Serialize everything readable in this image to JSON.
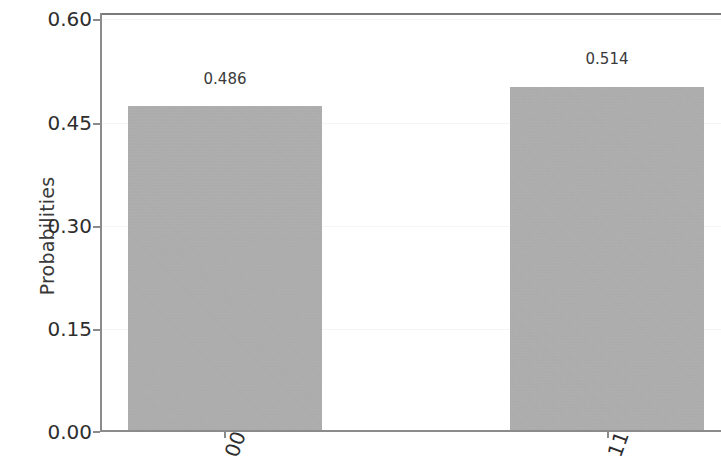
{
  "chart_data": {
    "type": "bar",
    "title": "",
    "subtitle": "",
    "xlabel": "",
    "ylabel": "Probabilities",
    "categories": [
      "00",
      "11"
    ],
    "values": [
      0.486,
      0.514
    ],
    "data_labels": [
      "0.486",
      "0.514"
    ],
    "series": [
      {
        "name": "Probabilities",
        "values": [
          0.486,
          0.514
        ]
      }
    ],
    "ylim": [
      0.0,
      0.6279
    ],
    "yticks": [
      0.0,
      0.15,
      0.3,
      0.45,
      0.6
    ],
    "ytick_labels": [
      "0.00",
      "0.15",
      "0.30",
      "0.45",
      "0.60"
    ],
    "xtick_labels": [
      "00",
      "11"
    ],
    "xtick_rotation": -70,
    "grid": true,
    "grid_axis": "y",
    "legend": null,
    "legend_position": "none",
    "bar_color": "#b2b2b2",
    "text_color": "#2e2e2e",
    "background_color": "#ffffff",
    "gridline_color": "#f4f4f6",
    "axis_color": "#8b8b8b"
  },
  "axes": {
    "y_title": "Probabilities",
    "y_ticks": [
      {
        "label": "0.60",
        "value": 0.6
      },
      {
        "label": "0.45",
        "value": 0.45
      },
      {
        "label": "0.30",
        "value": 0.3
      },
      {
        "label": "0.15",
        "value": 0.15
      },
      {
        "label": "0.00",
        "value": 0.0
      }
    ],
    "x_ticks": [
      {
        "label": "00"
      },
      {
        "label": "11"
      }
    ]
  },
  "bars": [
    {
      "category": "00",
      "value": 0.486,
      "label": "0.486"
    },
    {
      "category": "11",
      "value": 0.514,
      "label": "0.514"
    }
  ]
}
